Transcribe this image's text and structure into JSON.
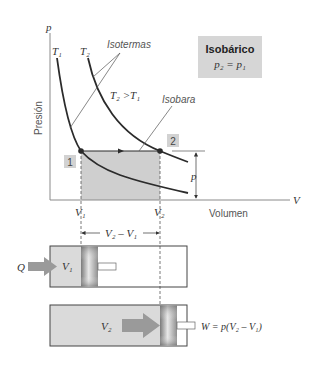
{
  "diagram": {
    "title_box": {
      "title": "Isobárico",
      "equation": "p₂ = p₁"
    },
    "axes": {
      "y_symbol": "p",
      "y_label": "Presión",
      "x_symbol": "V",
      "x_label": "Volumen"
    },
    "curves": {
      "t1_label": "T₁",
      "t2_label": "T₂",
      "isotherms_label": "Isotermas",
      "relation_label": "T₂ >T₁",
      "isobar_label": "Isobara"
    },
    "states": {
      "state1": "1",
      "state2": "2"
    },
    "ticks": {
      "v1": "V₁",
      "v2": "V₂"
    },
    "pressure_marker": "p",
    "pistons": {
      "delta_label": "V₂ – V₁",
      "heat_label": "Q",
      "v1_label": "V₁",
      "v2_label": "V₂",
      "work_label": "W = p(V₂ – V₁)"
    },
    "colors": {
      "shade": "#cfcfcf",
      "box": "#d6d6d6",
      "curve": "#2b2b2b",
      "axis": "#8a8a8a",
      "arrow": "#9a9a9a",
      "cylinder_fill": "#dadada"
    }
  }
}
